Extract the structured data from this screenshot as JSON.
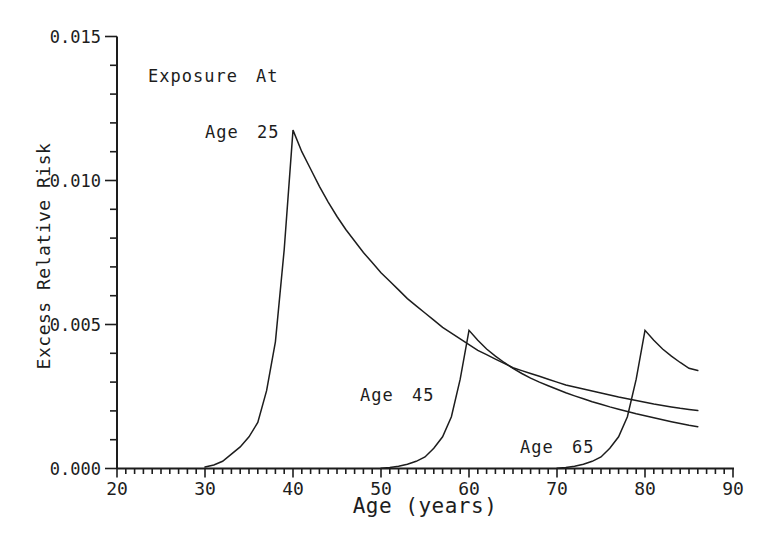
{
  "figure": {
    "background": "#ffffff",
    "ink_color": "#1d1d1d"
  },
  "chart_data": {
    "type": "line",
    "title": "",
    "xlabel": "Age (years)",
    "ylabel": "Excess Relative Risk",
    "xlim": [
      20,
      90
    ],
    "ylim": [
      0,
      0.015
    ],
    "grid": false,
    "legend": "inline curve annotations",
    "x_major_ticks": [
      20,
      30,
      40,
      50,
      60,
      70,
      80,
      90
    ],
    "x_minor_step": 1,
    "y_major_ticks": [
      0,
      0.005,
      0.01,
      0.015
    ],
    "y_major_tick_labels": [
      "0.000",
      "0.005",
      "0.010",
      "0.015"
    ],
    "y_minor_step": 0.001,
    "annotations": [
      {
        "text": "Exposure At",
        "x": 148,
        "y": 66
      },
      {
        "text": "Age 25",
        "x": 205,
        "y": 122
      },
      {
        "text": "Age 45",
        "x": 360,
        "y": 385
      },
      {
        "text": "Age 65",
        "x": 520,
        "y": 437
      }
    ],
    "series": [
      {
        "name": "Age 25",
        "exposure_age": 25,
        "peak": {
          "age": 40,
          "err": 0.0117
        },
        "points": [
          [
            30,
            5e-05
          ],
          [
            31,
            0.00012
          ],
          [
            32,
            0.00025
          ],
          [
            33,
            0.0005
          ],
          [
            34,
            0.00075
          ],
          [
            35,
            0.0011
          ],
          [
            36,
            0.0016
          ],
          [
            37,
            0.0027
          ],
          [
            38,
            0.0044
          ],
          [
            39,
            0.0076
          ],
          [
            40,
            0.01175
          ],
          [
            41,
            0.011
          ],
          [
            42,
            0.0104
          ],
          [
            43,
            0.0098
          ],
          [
            44,
            0.00925
          ],
          [
            45,
            0.00875
          ],
          [
            46,
            0.0083
          ],
          [
            47,
            0.0079
          ],
          [
            48,
            0.0075
          ],
          [
            49,
            0.00715
          ],
          [
            50,
            0.0068
          ],
          [
            51,
            0.0065
          ],
          [
            52,
            0.0062
          ],
          [
            53,
            0.0059
          ],
          [
            54,
            0.00565
          ],
          [
            55,
            0.0054
          ],
          [
            56,
            0.00515
          ],
          [
            57,
            0.0049
          ],
          [
            58,
            0.0047
          ],
          [
            59,
            0.0045
          ],
          [
            60,
            0.0043
          ],
          [
            61,
            0.0041
          ],
          [
            62,
            0.00395
          ],
          [
            63,
            0.0038
          ],
          [
            64,
            0.00365
          ],
          [
            65,
            0.0035
          ],
          [
            66,
            0.0034
          ],
          [
            67,
            0.0033
          ],
          [
            68,
            0.0032
          ],
          [
            69,
            0.0031
          ],
          [
            70,
            0.003
          ],
          [
            71,
            0.0029
          ],
          [
            72,
            0.00283
          ],
          [
            73,
            0.00276
          ],
          [
            74,
            0.00269
          ],
          [
            75,
            0.00262
          ],
          [
            76,
            0.00255
          ],
          [
            77,
            0.00248
          ],
          [
            78,
            0.00242
          ],
          [
            79,
            0.00236
          ],
          [
            80,
            0.0023
          ],
          [
            81,
            0.00224
          ],
          [
            82,
            0.00219
          ],
          [
            83,
            0.00214
          ],
          [
            84,
            0.00209
          ],
          [
            85,
            0.00205
          ],
          [
            86,
            0.00201
          ]
        ]
      },
      {
        "name": "Age 45",
        "exposure_age": 45,
        "peak": {
          "age": 60,
          "err": 0.0048
        },
        "points": [
          [
            50,
            1e-05
          ],
          [
            51,
            3e-05
          ],
          [
            52,
            8e-05
          ],
          [
            53,
            0.00015
          ],
          [
            54,
            0.00025
          ],
          [
            55,
            0.0004
          ],
          [
            56,
            0.0007
          ],
          [
            57,
            0.0011
          ],
          [
            58,
            0.0018
          ],
          [
            59,
            0.0031
          ],
          [
            60,
            0.0048
          ],
          [
            61,
            0.00445
          ],
          [
            62,
            0.00415
          ],
          [
            63,
            0.0039
          ],
          [
            64,
            0.00368
          ],
          [
            65,
            0.00348
          ],
          [
            66,
            0.0033
          ],
          [
            67,
            0.00314
          ],
          [
            68,
            0.003
          ],
          [
            69,
            0.00287
          ],
          [
            70,
            0.00275
          ],
          [
            71,
            0.00263
          ],
          [
            72,
            0.00252
          ],
          [
            73,
            0.00242
          ],
          [
            74,
            0.00232
          ],
          [
            75,
            0.00223
          ],
          [
            76,
            0.00214
          ],
          [
            77,
            0.00206
          ],
          [
            78,
            0.00198
          ],
          [
            79,
            0.0019
          ],
          [
            80,
            0.00183
          ],
          [
            81,
            0.00176
          ],
          [
            82,
            0.00169
          ],
          [
            83,
            0.00162
          ],
          [
            84,
            0.00156
          ],
          [
            85,
            0.0015
          ],
          [
            86,
            0.00145
          ]
        ]
      },
      {
        "name": "Age 65",
        "exposure_age": 65,
        "peak": {
          "age": 80,
          "err": 0.0048
        },
        "points": [
          [
            70,
            1e-05
          ],
          [
            71,
            3e-05
          ],
          [
            72,
            8e-05
          ],
          [
            73,
            0.00015
          ],
          [
            74,
            0.00025
          ],
          [
            75,
            0.0004
          ],
          [
            76,
            0.0007
          ],
          [
            77,
            0.0011
          ],
          [
            78,
            0.0018
          ],
          [
            79,
            0.0031
          ],
          [
            80,
            0.0048
          ],
          [
            81,
            0.00445
          ],
          [
            82,
            0.00415
          ],
          [
            83,
            0.0039
          ],
          [
            84,
            0.00368
          ],
          [
            85,
            0.00348
          ],
          [
            86,
            0.0034
          ]
        ]
      }
    ]
  }
}
